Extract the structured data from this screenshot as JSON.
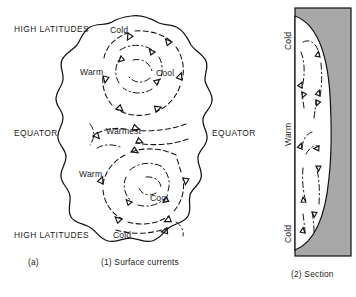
{
  "figure": {
    "background": "#ffffff",
    "ink": "#111111",
    "land_fill": "#a8a8a8"
  },
  "panel_map": {
    "caption_letter": "(a)",
    "caption": "(1) Surface currents",
    "outside_labels": {
      "high_latitudes_top": "HIGH LATITUDES",
      "high_latitudes_bottom": "HIGH LATITUDES",
      "equator_left": "EQUATOR",
      "equator_right": "EQUATOR"
    },
    "inside_labels": {
      "cold_top": "Cold",
      "warm_upper": "Warm",
      "cool_upper": "Cool",
      "warmest": "Warmest",
      "warm_lower": "Warm",
      "cool_lower": "Cool",
      "cold_bottom": "Cold"
    },
    "gyres": [
      {
        "name": "northern-gyre",
        "rotation": "clockwise"
      },
      {
        "name": "southern-gyre",
        "rotation": "counter-clockwise"
      }
    ]
  },
  "panel_section": {
    "caption": "(2) Section",
    "labels": {
      "cold_top": "Cold",
      "warm_middle": "Warm",
      "cold_bottom": "Cold"
    },
    "fill_color": "#a8a8a8"
  }
}
